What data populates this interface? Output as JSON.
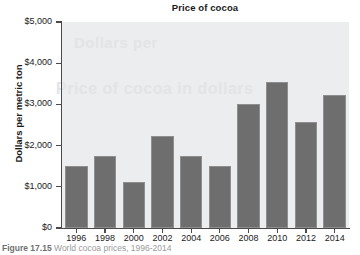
{
  "chart_data": {
    "type": "bar",
    "title": "Price of cocoa",
    "xlabel": "",
    "ylabel": "Dollars per metric ton",
    "categories": [
      "1996",
      "1998",
      "2000",
      "2002",
      "2004",
      "2006",
      "2008",
      "2010",
      "2012",
      "2014"
    ],
    "values": [
      1500,
      1750,
      1120,
      2230,
      1750,
      1500,
      3000,
      3550,
      2570,
      3220
    ],
    "ylim": [
      0,
      5000
    ],
    "ytick_values": [
      0,
      1000,
      2000,
      3000,
      4000,
      5000
    ],
    "ytick_labels": [
      "$0",
      "$1,000",
      "$2,000",
      "$3,000",
      "$4,000",
      "$5,000"
    ],
    "grid": false,
    "legend": "none",
    "bar_color": "#6e6e6e",
    "bar_edge_color": "#8e8e8e",
    "plot_background": "#ecedee",
    "axis_color": "#4a4a4a",
    "text_color": "#1a1a1a"
  },
  "watermark": {
    "line1": "Dollars per",
    "line2": "Price of cocoa in dollars"
  },
  "caption": {
    "label": "Figure",
    "number": "17.15",
    "text": "World cocoa prices, 1996-2014"
  }
}
